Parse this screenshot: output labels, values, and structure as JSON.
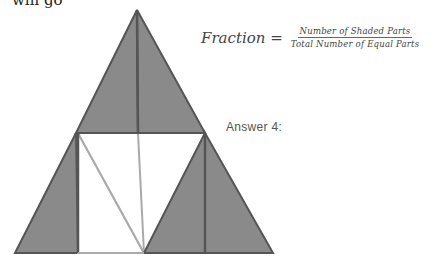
{
  "header": {
    "left_clipped_text": "will go",
    "right_clipped_text": "... ..."
  },
  "formula": {
    "lhs": "Fraction =",
    "numerator": "Number of Shaded Parts",
    "denominator": "Total Number of Equal Parts"
  },
  "answer_label": "Answer 4:",
  "figure": {
    "shaded_color": "#8a8a8a",
    "outline_color": "#555555",
    "unshaded_line_color": "#aaaaaa",
    "total_parts": 8,
    "shaded_parts": 6
  }
}
